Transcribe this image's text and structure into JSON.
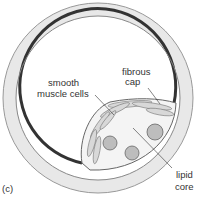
{
  "figure": {
    "panel_label": "(c)",
    "labels": {
      "fibrous_cap_line1": "fibrous",
      "fibrous_cap_line2": "cap",
      "smooth_muscle_line1": "smooth",
      "smooth_muscle_line2": "muscle cells",
      "lipid_core_line1": "lipid",
      "lipid_core_line2": "core"
    },
    "colors": {
      "outer_wall": "#e6e6e6",
      "inner_lining": "#333333",
      "plaque_gray": "#cfcfcf",
      "lipid_blob": "#b8b8b8"
    }
  }
}
